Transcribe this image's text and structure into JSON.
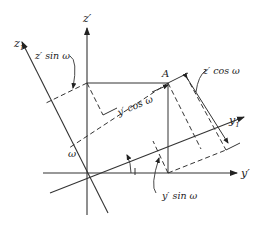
{
  "diagram": {
    "type": "coordinate-rotation",
    "labels": {
      "z_prime": "z′",
      "z1": "z",
      "z1_sub": "1",
      "y1": "y",
      "y1_sub": "1",
      "y_prime": "y′",
      "point": "A",
      "omega": "ω",
      "z_sin": "z′ sin ω",
      "z_cos": "z′ cos ω",
      "y_cos": "y′ cos ω",
      "y_sin": "y′ sin ω"
    },
    "colors": {
      "line": "#333333",
      "background": "#ffffff"
    }
  }
}
